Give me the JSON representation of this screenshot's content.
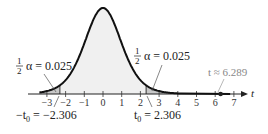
{
  "chart_data": {
    "type": "area",
    "title": "",
    "xlabel": "t",
    "ylabel": "",
    "x_ticks": [
      -3,
      -2,
      -1,
      0,
      1,
      2,
      3,
      4,
      5,
      6,
      7
    ],
    "xlim": [
      -3.6,
      7.6
    ],
    "grid": false,
    "critical_values": {
      "left": -2.306,
      "right": 2.306
    },
    "tail_area_each": 0.025,
    "test_statistic": 6.289,
    "annotations": [
      {
        "text": "½α = 0.025",
        "points_to": "left tail"
      },
      {
        "text": "½α = 0.025",
        "points_to": "right tail"
      },
      {
        "text": "−t₀ = −2.306",
        "points_to": -2.306
      },
      {
        "text": "t₀ = 2.306",
        "points_to": 2.306
      },
      {
        "text": "t ≈ 6.289",
        "points_to": 6.289
      }
    ]
  },
  "labels": {
    "left_alpha_half": "1",
    "left_alpha_den": "2",
    "left_alpha_rest": "α = 0.025",
    "right_alpha_half": "1",
    "right_alpha_den": "2",
    "right_alpha_rest": "α = 0.025",
    "left_crit_prefix": "−t",
    "left_crit_sub": "0",
    "left_crit_rest": " = −2.306",
    "right_crit_prefix": "t",
    "right_crit_sub": "0",
    "right_crit_rest": " = 2.306",
    "test_stat": "t ≈ 6.289",
    "axis_label": "t"
  },
  "ticks": [
    "−3",
    "−2",
    "−1",
    "0",
    "1",
    "2",
    "3",
    "4",
    "5",
    "6",
    "7"
  ]
}
